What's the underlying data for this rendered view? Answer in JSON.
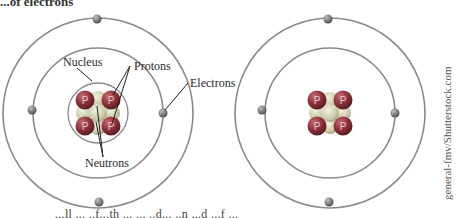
{
  "heading": "...of electrons",
  "footer_text": "...ll ... ..f...th ... ... ..d... ..n ...d ...f ...",
  "credit": "general-fmv/Shutterstock.com",
  "labels": {
    "nucleus": "Nucleus",
    "protons": "Protons",
    "electrons": "Electrons",
    "neutrons": "Neutrons"
  },
  "particle_glyph": "P",
  "colors": {
    "orbit": "#8a8a8a",
    "proton": "#8b2f3a",
    "proton_highlight": "#c46a6f",
    "neutron": "#c9c9a6",
    "neutron_center": "#e8e8d8",
    "electron": "#7a7a7a",
    "leader_line": "#222222"
  },
  "atoms": [
    {
      "name": "labeled-atom",
      "center": [
        98,
        113
      ],
      "orbits": [
        30,
        65,
        95
      ],
      "protons": 4,
      "neutrons": 5,
      "electrons": 4
    },
    {
      "name": "unlabeled-atom",
      "center": [
        330,
        113
      ],
      "orbits": [
        65,
        95
      ],
      "protons": 4,
      "neutrons": 5,
      "electrons": 4
    }
  ]
}
